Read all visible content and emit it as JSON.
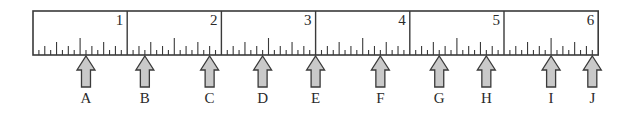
{
  "ruler": {
    "unit": "inch",
    "subdivisions_per_inch": 16,
    "length_inches": 6,
    "inch_labels": [
      "1",
      "2",
      "3",
      "4",
      "5",
      "6"
    ],
    "colors": {
      "outline": "#3a3a3a",
      "ticks": "#3a3a3a",
      "arrow_fill": "#c9c9c9",
      "arrow_stroke": "#3a3a3a",
      "text": "#2a2a2a"
    }
  },
  "markers": [
    {
      "label": "A",
      "position_sixteenths": 9
    },
    {
      "label": "B",
      "position_sixteenths": 19
    },
    {
      "label": "C",
      "position_sixteenths": 30
    },
    {
      "label": "D",
      "position_sixteenths": 39
    },
    {
      "label": "E",
      "position_sixteenths": 48
    },
    {
      "label": "F",
      "position_sixteenths": 59
    },
    {
      "label": "G",
      "position_sixteenths": 69
    },
    {
      "label": "H",
      "position_sixteenths": 77
    },
    {
      "label": "I",
      "position_sixteenths": 88
    },
    {
      "label": "J",
      "position_sixteenths": 95
    }
  ]
}
